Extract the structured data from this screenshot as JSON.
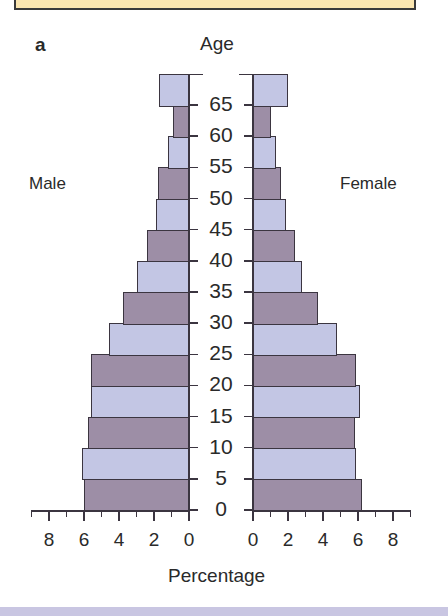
{
  "panel_label": "a",
  "colors": {
    "light": "#c3c6e4",
    "dark": "#9d8ea6",
    "box": "#fbe6b0",
    "band": "#c9c6e2"
  },
  "chart_data": {
    "type": "bar",
    "subtype": "population-pyramid",
    "title": "Age",
    "xlabel": "Percentage",
    "left_label": "Male",
    "right_label": "Female",
    "age_ticks": [
      "0",
      "5",
      "10",
      "15",
      "20",
      "25",
      "30",
      "35",
      "40",
      "45",
      "50",
      "55",
      "60",
      "65"
    ],
    "x_ticks_left": [
      "8",
      "6",
      "4",
      "2",
      "0"
    ],
    "x_ticks_right": [
      "0",
      "2",
      "4",
      "6",
      "8"
    ],
    "xlim": [
      0,
      9
    ],
    "categories": [
      "0-4",
      "5-9",
      "10-14",
      "15-19",
      "20-24",
      "25-29",
      "30-34",
      "35-39",
      "40-44",
      "45-49",
      "50-54",
      "55-59",
      "60-64",
      "65+"
    ],
    "series": [
      {
        "name": "Male",
        "values": [
          6.0,
          6.1,
          5.8,
          5.6,
          5.6,
          4.6,
          3.75,
          2.95,
          2.4,
          1.9,
          1.75,
          1.2,
          0.9,
          1.7
        ]
      },
      {
        "name": "Female",
        "values": [
          6.2,
          5.9,
          5.8,
          6.1,
          5.9,
          4.8,
          3.7,
          2.8,
          2.4,
          1.9,
          1.6,
          1.3,
          1.0,
          2.0
        ]
      }
    ]
  }
}
